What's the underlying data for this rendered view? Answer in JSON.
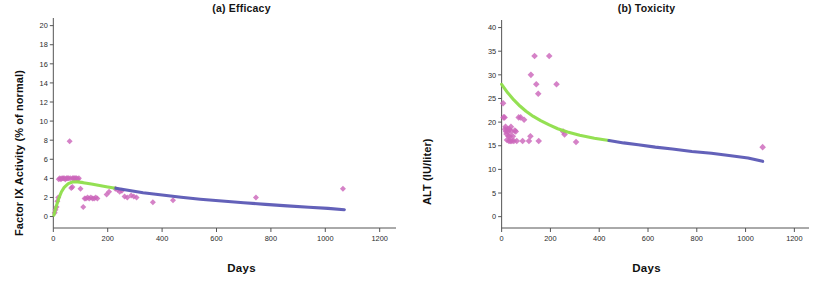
{
  "figure": {
    "panels": [
      {
        "id": "efficacy",
        "title": "(a) Efficacy",
        "xlabel": "Days",
        "ylabel": "Factor IX Activity (% of normal)"
      },
      {
        "id": "toxicity",
        "title": "(b) Toxicity",
        "xlabel": "Days",
        "ylabel": "ALT (IU/liter)"
      }
    ]
  },
  "colors": {
    "scatter": "#c濃",
    "scatter_point": "#cc66bb",
    "curve_early": "#8ede4a",
    "curve_late": "#5b58b5",
    "axis": "#555555",
    "text": "#141414",
    "background": "#ffffff"
  },
  "chart_data": [
    {
      "type": "scatter",
      "id": "efficacy",
      "title": "(a) Efficacy",
      "xlabel": "Days",
      "ylabel": "Factor IX Activity (% of normal)",
      "xlim": [
        -60,
        1260
      ],
      "ylim": [
        -1.2,
        20.8
      ],
      "xticks": [
        0,
        200,
        400,
        600,
        800,
        1000,
        1200
      ],
      "yticks": [
        0,
        2,
        4,
        6,
        8,
        10,
        12,
        14,
        16,
        18,
        20
      ],
      "grid": false,
      "legend": "none",
      "series": [
        {
          "name": "Observed Factor IX activity",
          "kind": "scatter",
          "marker": "diamond",
          "color": "#cc66bb",
          "points": [
            [
              5,
              0.4
            ],
            [
              8,
              0.7
            ],
            [
              12,
              1.0
            ],
            [
              15,
              1.6
            ],
            [
              18,
              2.0
            ],
            [
              20,
              3.9
            ],
            [
              24,
              4.0
            ],
            [
              28,
              3.9
            ],
            [
              32,
              4.0
            ],
            [
              36,
              4.0
            ],
            [
              40,
              4.0
            ],
            [
              44,
              3.9
            ],
            [
              48,
              4.0
            ],
            [
              52,
              4.0
            ],
            [
              56,
              4.0
            ],
            [
              60,
              7.9
            ],
            [
              62,
              4.0
            ],
            [
              66,
              3.0
            ],
            [
              70,
              4.0
            ],
            [
              74,
              4.0
            ],
            [
              78,
              4.0
            ],
            [
              82,
              4.0
            ],
            [
              86,
              4.0
            ],
            [
              90,
              3.9
            ],
            [
              94,
              4.0
            ],
            [
              70,
              3.1
            ],
            [
              100,
              2.9
            ],
            [
              110,
              1.0
            ],
            [
              115,
              1.9
            ],
            [
              120,
              1.9
            ],
            [
              126,
              2.0
            ],
            [
              132,
              1.9
            ],
            [
              138,
              2.0
            ],
            [
              144,
              1.9
            ],
            [
              150,
              1.9
            ],
            [
              156,
              2.0
            ],
            [
              162,
              1.9
            ],
            [
              196,
              2.3
            ],
            [
              205,
              2.6
            ],
            [
              228,
              2.9
            ],
            [
              236,
              2.8
            ],
            [
              244,
              2.6
            ],
            [
              252,
              2.7
            ],
            [
              262,
              2.1
            ],
            [
              272,
              2.0
            ],
            [
              286,
              2.2
            ],
            [
              296,
              2.1
            ],
            [
              306,
              2.0
            ],
            [
              366,
              1.5
            ],
            [
              440,
              1.7
            ],
            [
              745,
              2.0
            ],
            [
              1065,
              2.9
            ]
          ]
        },
        {
          "name": "Model fit (early phase)",
          "kind": "line",
          "color": "#8ede4a",
          "points": [
            [
              2,
              0.15
            ],
            [
              10,
              1.0
            ],
            [
              20,
              1.9
            ],
            [
              30,
              2.6
            ],
            [
              40,
              3.05
            ],
            [
              55,
              3.45
            ],
            [
              70,
              3.62
            ],
            [
              90,
              3.63
            ],
            [
              110,
              3.55
            ],
            [
              140,
              3.4
            ],
            [
              170,
              3.25
            ],
            [
              200,
              3.1
            ],
            [
              230,
              2.96
            ]
          ]
        },
        {
          "name": "Model fit (late phase)",
          "kind": "line",
          "color": "#5b58b5",
          "points": [
            [
              230,
              2.96
            ],
            [
              280,
              2.72
            ],
            [
              330,
              2.5
            ],
            [
              400,
              2.25
            ],
            [
              470,
              2.02
            ],
            [
              540,
              1.82
            ],
            [
              620,
              1.62
            ],
            [
              700,
              1.44
            ],
            [
              780,
              1.28
            ],
            [
              860,
              1.12
            ],
            [
              940,
              0.98
            ],
            [
              1010,
              0.86
            ],
            [
              1070,
              0.72
            ]
          ]
        }
      ]
    },
    {
      "type": "scatter",
      "id": "toxicity",
      "title": "(b) Toxicity",
      "xlabel": "Days",
      "ylabel": "ALT (IU/liter)",
      "xlim": [
        -60,
        1260
      ],
      "ylim": [
        -2.4,
        41.6
      ],
      "xticks": [
        0,
        200,
        400,
        600,
        800,
        1000,
        1200
      ],
      "yticks": [
        0,
        5,
        10,
        15,
        20,
        25,
        30,
        35,
        40
      ],
      "grid": false,
      "legend": "none",
      "series": [
        {
          "name": "Observed ALT",
          "kind": "scatter",
          "marker": "diamond",
          "color": "#cc66bb",
          "points": [
            [
              6,
              24.0
            ],
            [
              8,
              21.0
            ],
            [
              12,
              21.0
            ],
            [
              14,
              18.5
            ],
            [
              16,
              19.0
            ],
            [
              18,
              18.0
            ],
            [
              20,
              17.5
            ],
            [
              22,
              16.2
            ],
            [
              24,
              18.5
            ],
            [
              26,
              18.0
            ],
            [
              28,
              17.0
            ],
            [
              30,
              16.0
            ],
            [
              32,
              18.5
            ],
            [
              34,
              17.0
            ],
            [
              36,
              16.0
            ],
            [
              38,
              19.0
            ],
            [
              40,
              18.0
            ],
            [
              42,
              16.0
            ],
            [
              46,
              17.0
            ],
            [
              50,
              16.0
            ],
            [
              54,
              18.2
            ],
            [
              58,
              18.0
            ],
            [
              62,
              16.0
            ],
            [
              70,
              21.0
            ],
            [
              78,
              21.0
            ],
            [
              86,
              16.0
            ],
            [
              92,
              20.5
            ],
            [
              112,
              16.0
            ],
            [
              118,
              17.0
            ],
            [
              120,
              30.0
            ],
            [
              135,
              34.0
            ],
            [
              142,
              28.0
            ],
            [
              150,
              26.0
            ],
            [
              152,
              16.0
            ],
            [
              195,
              34.0
            ],
            [
              225,
              28.0
            ],
            [
              252,
              18.0
            ],
            [
              258,
              17.4
            ],
            [
              305,
              15.8
            ],
            [
              1070,
              14.7
            ]
          ]
        },
        {
          "name": "Model fit (early phase)",
          "kind": "line",
          "color": "#8ede4a",
          "points": [
            [
              0,
              28.0
            ],
            [
              25,
              26.2
            ],
            [
              50,
              24.7
            ],
            [
              75,
              23.4
            ],
            [
              100,
              22.3
            ],
            [
              130,
              21.2
            ],
            [
              160,
              20.3
            ],
            [
              195,
              19.4
            ],
            [
              230,
              18.6
            ],
            [
              270,
              17.9
            ],
            [
              320,
              17.2
            ],
            [
              380,
              16.6
            ],
            [
              440,
              16.1
            ]
          ]
        },
        {
          "name": "Model fit (late phase)",
          "kind": "line",
          "color": "#5b58b5",
          "points": [
            [
              440,
              16.1
            ],
            [
              500,
              15.6
            ],
            [
              560,
              15.2
            ],
            [
              630,
              14.7
            ],
            [
              700,
              14.3
            ],
            [
              780,
              13.8
            ],
            [
              860,
              13.4
            ],
            [
              940,
              12.9
            ],
            [
              1010,
              12.4
            ],
            [
              1070,
              11.7
            ]
          ]
        }
      ]
    }
  ]
}
